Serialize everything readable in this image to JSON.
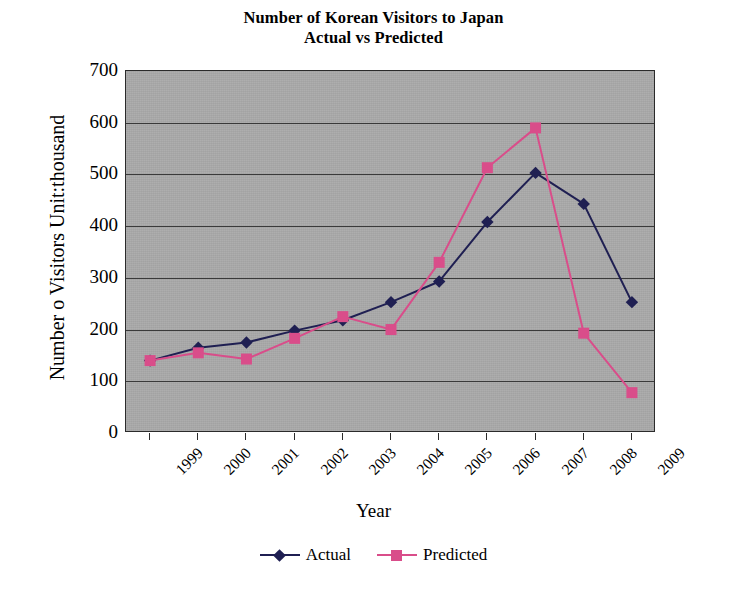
{
  "chart_data": {
    "type": "line",
    "title": "Number of Korean Visitors to Japan",
    "subtitle": "Actual vs Predicted",
    "xlabel": "Year",
    "ylabel": "Number o Visitors Unit:thousand",
    "categories": [
      "1999",
      "2000",
      "2001",
      "2002",
      "2003",
      "2004",
      "2005",
      "2006",
      "2007",
      "2008",
      "2009"
    ],
    "ylim": [
      0,
      700
    ],
    "yticks": [
      700,
      600,
      500,
      400,
      300,
      200,
      100,
      0
    ],
    "grid": "horizontal",
    "legend_position": "bottom",
    "series": [
      {
        "name": "Actual",
        "color": "#1f1f52",
        "marker": "diamond",
        "values": [
          140,
          165,
          175,
          198,
          218,
          253,
          293,
          408,
          503,
          443,
          253
        ]
      },
      {
        "name": "Predicted",
        "color": "#d94d8a",
        "marker": "square",
        "values": [
          140,
          155,
          143,
          183,
          225,
          200,
          330,
          513,
          590,
          193,
          78
        ]
      }
    ]
  },
  "title": {
    "line1": "Number of Korean Visitors to Japan",
    "line2": "Actual vs Predicted"
  },
  "axes": {
    "y_title": "Number o Visitors Unit:thousand",
    "x_title": "Year"
  },
  "legend": {
    "items": [
      {
        "label": "Actual",
        "color": "#1f1f52",
        "marker": "diamond"
      },
      {
        "label": "Predicted",
        "color": "#d94d8a",
        "marker": "square"
      }
    ]
  },
  "plot_style": {
    "background": "#a9a9a9",
    "gridline_color": "#3a3a3a",
    "border_color": "#2b2b2b"
  }
}
